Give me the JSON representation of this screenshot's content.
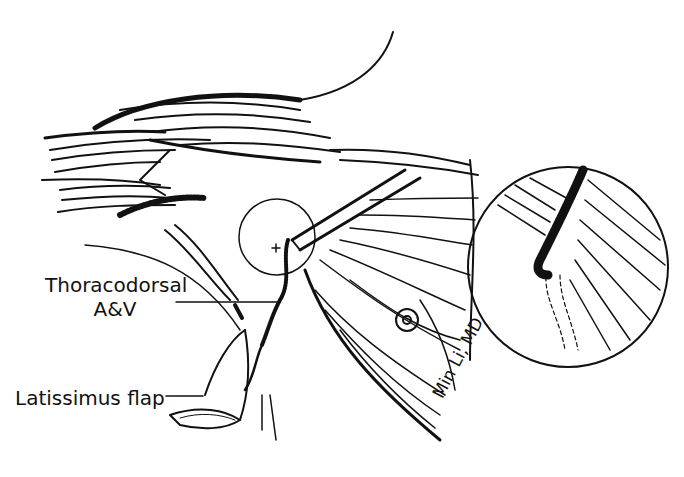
{
  "figure": {
    "type": "surgical-illustration",
    "labels": {
      "thoracodorsal_line1": "Thoracodorsal",
      "thoracodorsal_line2": "A&V",
      "latissimus": "Latissimus flap"
    },
    "signature": "Min Li, MD",
    "colors": {
      "ink": "#111111",
      "background": "#ffffff"
    }
  }
}
